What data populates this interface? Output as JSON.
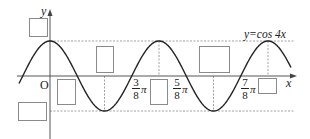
{
  "figure": {
    "function_label": "y=cos 4x",
    "axis_x_label": "x",
    "axis_y_label": "y",
    "origin_label": "O",
    "colors": {
      "curve": "#222222",
      "axes": "#555555",
      "dashed": "#888888",
      "box_border": "#8a8a8a",
      "text": "#222222"
    },
    "tick_labels": [
      {
        "id": "3-8-pi",
        "numerator": "3",
        "denominator": "8",
        "suffix": "π",
        "value": "3π/8"
      },
      {
        "id": "5-8-pi",
        "numerator": "5",
        "denominator": "8",
        "suffix": "π",
        "value": "5π/8"
      },
      {
        "id": "7-8-pi",
        "numerator": "7",
        "denominator": "8",
        "suffix": "π",
        "value": "7π/8"
      }
    ],
    "blank_boxes": [
      {
        "id": "box-max-y",
        "x": 29,
        "y": 18,
        "w": 19,
        "h": 19,
        "value": ""
      },
      {
        "id": "box-min-y",
        "x": 18,
        "y": 102,
        "w": 29,
        "h": 19,
        "value": ""
      },
      {
        "id": "box-first-zero",
        "x": 57,
        "y": 79,
        "w": 19,
        "h": 26,
        "value": ""
      },
      {
        "id": "box-first-trough",
        "x": 96,
        "y": 46,
        "w": 18,
        "h": 27,
        "value": ""
      },
      {
        "id": "box-between",
        "x": 150,
        "y": 79,
        "w": 18,
        "h": 26,
        "value": ""
      },
      {
        "id": "box-second-trough",
        "x": 199,
        "y": 46,
        "w": 31,
        "h": 27,
        "value": ""
      },
      {
        "id": "box-period",
        "x": 258,
        "y": 78,
        "w": 19,
        "h": 16,
        "value": ""
      }
    ]
  },
  "chart_data": {
    "type": "line",
    "xlabel": "x",
    "ylabel": "y",
    "function": "cos(4x)",
    "x_range": [
      -0.15,
      1.65
    ],
    "ylim": [
      -1,
      1
    ],
    "period": "π/2",
    "amplitude": 1,
    "labeled_x_ticks": [
      "3π/8",
      "5π/8",
      "7π/8"
    ],
    "key_points": [
      {
        "x": "0",
        "y": 1,
        "kind": "max"
      },
      {
        "x": "π/8",
        "y": 0,
        "kind": "zero"
      },
      {
        "x": "π/4",
        "y": -1,
        "kind": "min"
      },
      {
        "x": "3π/8",
        "y": 0,
        "kind": "zero"
      },
      {
        "x": "π/2",
        "y": 1,
        "kind": "max"
      },
      {
        "x": "5π/8",
        "y": 0,
        "kind": "zero"
      },
      {
        "x": "3π/4",
        "y": -1,
        "kind": "min"
      },
      {
        "x": "7π/8",
        "y": 0,
        "kind": "zero"
      },
      {
        "x": "π",
        "y": 1,
        "kind": "max"
      }
    ],
    "reference_lines": [
      {
        "type": "horizontal",
        "y": 1,
        "style": "dashed"
      },
      {
        "type": "horizontal",
        "y": -1,
        "style": "dashed"
      },
      {
        "type": "vertical",
        "x": "π/4",
        "style": "dashed"
      },
      {
        "type": "vertical",
        "x": "π/2",
        "style": "dashed"
      },
      {
        "type": "vertical",
        "x": "3π/4",
        "style": "dashed"
      },
      {
        "type": "vertical",
        "x": "π",
        "style": "dashed"
      }
    ],
    "grid": false,
    "legend": "none"
  }
}
